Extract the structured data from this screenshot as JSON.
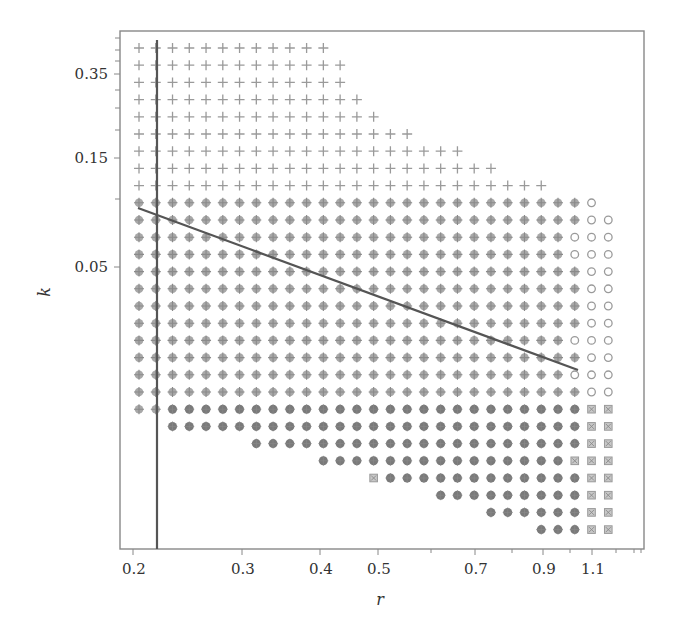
{
  "chart_data": {
    "type": "scatter",
    "title": "",
    "xlabel": "r",
    "ylabel": "k",
    "x_scale": "log",
    "y_scale": "log",
    "x_ticks": [
      "0.2",
      "0.3",
      "0.4",
      "0.5",
      "0.7",
      "0.9",
      "1.1"
    ],
    "y_ticks": [
      "0.35",
      "0.15",
      "0.05"
    ],
    "grid": false,
    "legend": null,
    "marker_types": {
      "plus": "cross marker (+)",
      "cross_dot": "grey filled circle with cross",
      "open_circle": "open circle",
      "dark_dot": "dark filled circle",
      "square": "small hatched square"
    },
    "grid_columns": 29,
    "row_layout": [
      {
        "marker": "plus",
        "segments": [
          [
            0,
            11,
            "plus"
          ]
        ]
      },
      {
        "marker": "plus",
        "segments": [
          [
            0,
            12,
            "plus"
          ]
        ]
      },
      {
        "marker": "plus",
        "segments": [
          [
            0,
            12,
            "plus"
          ]
        ]
      },
      {
        "marker": "plus",
        "segments": [
          [
            0,
            13,
            "plus"
          ]
        ]
      },
      {
        "marker": "plus",
        "segments": [
          [
            0,
            14,
            "plus"
          ]
        ]
      },
      {
        "marker": "plus",
        "segments": [
          [
            0,
            16,
            "plus"
          ]
        ]
      },
      {
        "marker": "plus",
        "segments": [
          [
            0,
            19,
            "plus"
          ]
        ]
      },
      {
        "marker": "plus",
        "segments": [
          [
            0,
            21,
            "plus"
          ]
        ]
      },
      {
        "marker": "plus",
        "segments": [
          [
            0,
            24,
            "plus"
          ]
        ]
      },
      {
        "marker": "mixed",
        "segments": [
          [
            0,
            26,
            "cross_dot"
          ],
          [
            27,
            27,
            "open_circle"
          ]
        ]
      },
      {
        "marker": "mixed",
        "segments": [
          [
            0,
            26,
            "cross_dot"
          ],
          [
            27,
            28,
            "open_circle"
          ]
        ]
      },
      {
        "marker": "mixed",
        "segments": [
          [
            0,
            25,
            "cross_dot"
          ],
          [
            26,
            28,
            "open_circle"
          ]
        ]
      },
      {
        "marker": "mixed",
        "segments": [
          [
            0,
            25,
            "cross_dot"
          ],
          [
            26,
            28,
            "open_circle"
          ]
        ]
      },
      {
        "marker": "mixed",
        "segments": [
          [
            0,
            26,
            "cross_dot"
          ],
          [
            27,
            28,
            "open_circle"
          ]
        ]
      },
      {
        "marker": "mixed",
        "segments": [
          [
            0,
            26,
            "cross_dot"
          ],
          [
            27,
            28,
            "open_circle"
          ]
        ]
      },
      {
        "marker": "mixed",
        "segments": [
          [
            0,
            26,
            "cross_dot"
          ],
          [
            27,
            28,
            "open_circle"
          ]
        ]
      },
      {
        "marker": "mixed",
        "segments": [
          [
            0,
            26,
            "cross_dot"
          ],
          [
            27,
            28,
            "open_circle"
          ]
        ]
      },
      {
        "marker": "mixed",
        "segments": [
          [
            0,
            25,
            "cross_dot"
          ],
          [
            26,
            28,
            "open_circle"
          ]
        ]
      },
      {
        "marker": "mixed",
        "segments": [
          [
            0,
            26,
            "cross_dot"
          ],
          [
            27,
            28,
            "open_circle"
          ]
        ]
      },
      {
        "marker": "mixed",
        "segments": [
          [
            0,
            25,
            "cross_dot"
          ],
          [
            26,
            28,
            "open_circle"
          ]
        ]
      },
      {
        "marker": "mixed",
        "segments": [
          [
            0,
            26,
            "cross_dot"
          ],
          [
            27,
            28,
            "open_circle"
          ]
        ]
      },
      {
        "marker": "mixed",
        "segments": [
          [
            0,
            1,
            "cross_dot"
          ],
          [
            2,
            26,
            "dark_dot"
          ],
          [
            27,
            28,
            "square"
          ]
        ]
      },
      {
        "marker": "mixed",
        "segments": [
          [
            2,
            26,
            "dark_dot"
          ],
          [
            27,
            28,
            "square"
          ]
        ]
      },
      {
        "marker": "mixed",
        "segments": [
          [
            7,
            26,
            "dark_dot"
          ],
          [
            27,
            28,
            "square"
          ]
        ]
      },
      {
        "marker": "mixed",
        "segments": [
          [
            11,
            25,
            "dark_dot"
          ],
          [
            26,
            28,
            "square"
          ]
        ]
      },
      {
        "marker": "mixed",
        "segments": [
          [
            14,
            14,
            "square"
          ],
          [
            15,
            26,
            "dark_dot"
          ],
          [
            27,
            28,
            "square"
          ]
        ]
      },
      {
        "marker": "mixed",
        "segments": [
          [
            18,
            26,
            "dark_dot"
          ],
          [
            27,
            28,
            "square"
          ]
        ]
      },
      {
        "marker": "mixed",
        "segments": [
          [
            21,
            26,
            "dark_dot"
          ],
          [
            27,
            28,
            "square"
          ]
        ]
      },
      {
        "marker": "mixed",
        "segments": [
          [
            24,
            26,
            "dark_dot"
          ],
          [
            27,
            28,
            "square"
          ]
        ]
      }
    ],
    "annotations": [
      {
        "type": "vertical_line",
        "x_value": 0.22
      },
      {
        "type": "line_segment",
        "from": [
          0.205,
          0.095
        ],
        "to": [
          1.03,
          0.0145
        ],
        "description": "decreasing boundary line"
      }
    ]
  },
  "layout": {
    "plot_left": 120,
    "plot_top": 31,
    "plot_right": 644,
    "plot_bottom": 549,
    "col_x0": 139,
    "col_dx": 16.76,
    "row_y0": 48,
    "row_dy": 17.2,
    "x_tick_px": [
      133,
      242,
      320,
      378,
      475,
      543,
      592
    ],
    "x_minor_ticks_px": [
      431,
      512,
      570,
      616,
      634,
      641
    ],
    "y_tick_px": [
      74,
      158,
      267
    ],
    "y_minor_ticks_px": [
      38,
      50,
      61,
      90,
      108,
      130,
      199
    ],
    "vline": {
      "x": 157,
      "y1": 40,
      "y2": 549
    },
    "diag": {
      "x1": 138,
      "y1": 208,
      "x2": 578,
      "y2": 370
    }
  },
  "colors": {
    "axis": "#888888",
    "marker_light": "#9a9a9a",
    "marker_dark": "#6e6e6e",
    "line": "#555555",
    "text": "#333333"
  }
}
